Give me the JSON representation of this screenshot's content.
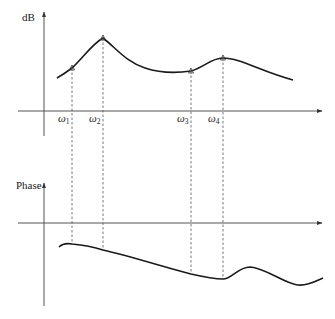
{
  "figure": {
    "type": "bode-plot-sketch",
    "magnitude_plot": {
      "y_axis_label": "dB",
      "x_axis_label": "",
      "frequency_markers": [
        {
          "symbol": "ω",
          "subscript": "1",
          "feature": "rising slope point"
        },
        {
          "symbol": "ω",
          "subscript": "2",
          "feature": "primary resonance peak"
        },
        {
          "symbol": "ω",
          "subscript": "3",
          "feature": "local minimum / valley"
        },
        {
          "symbol": "ω",
          "subscript": "4",
          "feature": "secondary resonance peak"
        }
      ]
    },
    "phase_plot": {
      "y_axis_label": "Phase",
      "x_axis_label": "",
      "description": "phase below zero, slowly decreasing, with a bump after ω4"
    },
    "colors": {
      "curve": "#1a1a1a",
      "axis": "#555555",
      "background": "#ffffff"
    }
  }
}
